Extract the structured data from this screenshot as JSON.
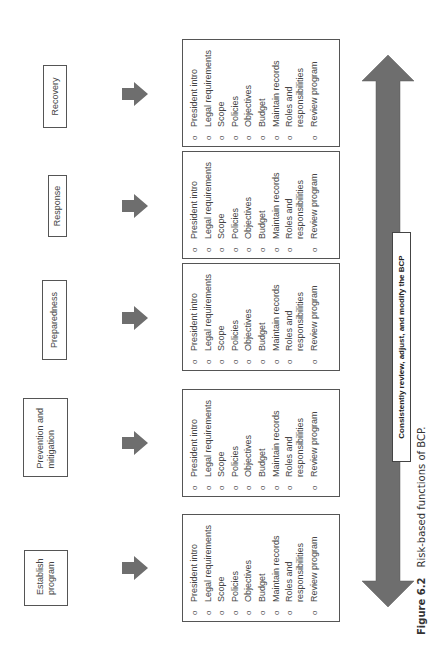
{
  "diagram": {
    "title": "Risk-based functions of BCP",
    "orientation": "rotated 90° counter-clockwise",
    "phases": [
      {
        "label": "Establish program",
        "items": [
          "President intro",
          "Legal requirements",
          "Scope",
          "Policies",
          "Objectives",
          "Budget",
          "Maintain records",
          "Roles and responsibilities",
          "Review program"
        ]
      },
      {
        "label": "Prevention and mitigation",
        "items": [
          "President intro",
          "Legal requirements",
          "Scope",
          "Policies",
          "Objectives",
          "Budget",
          "Maintain records",
          "Roles and responsibilities",
          "Review program"
        ]
      },
      {
        "label": "Preparedness",
        "items": [
          "President intro",
          "Legal requirements",
          "Scope",
          "Policies",
          "Objectives",
          "Budget",
          "Maintain records",
          "Roles and responsibilities",
          "Review program"
        ]
      },
      {
        "label": "Response",
        "items": [
          "President intro",
          "Legal requirements",
          "Scope",
          "Policies",
          "Objectives",
          "Budget",
          "Maintain records",
          "Roles and responsibilities",
          "Review program"
        ]
      },
      {
        "label": "Recovery",
        "items": [
          "President intro",
          "Legal requirements",
          "Scope",
          "Policies",
          "Objectives",
          "Budget",
          "Maintain records",
          "Roles and responsibilities",
          "Review program"
        ]
      }
    ],
    "bullet": "o",
    "cycle_banner": "Consistently review, adjust, and modify the BCP",
    "arrow_color": "#6e6e6e",
    "border_color": "#555555"
  },
  "caption": {
    "figure_number": "Figure 6.2",
    "text": "Risk-based functions of BCP."
  }
}
